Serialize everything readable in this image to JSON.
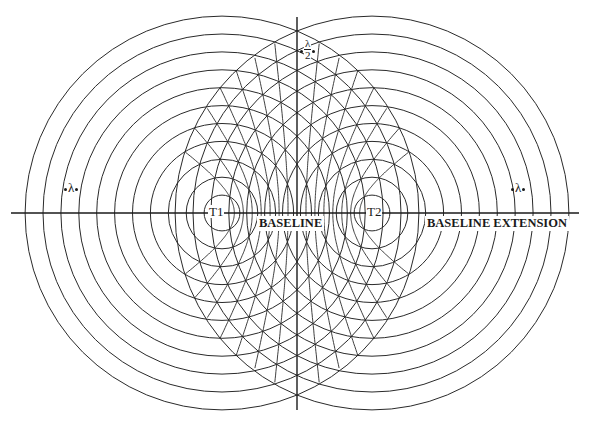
{
  "figure": {
    "type": "two-source interference pattern (circles and hyperbolas)",
    "line_color": "#2a2a2a",
    "background": "#ffffff"
  },
  "geometry": {
    "baseline_y": 213,
    "baseline_x_start": 11,
    "baseline_x_end": 579,
    "center_line_x": 297,
    "center_line_y_start": 17,
    "center_line_y_end": 410,
    "source_1": {
      "x": 222,
      "y": 213
    },
    "source_2": {
      "x": 372,
      "y": 213
    },
    "ring_spacing": 17.9,
    "ring_count": 11,
    "hyperbola_orders": [
      -7,
      -6,
      -5,
      -4,
      -3,
      -2,
      -1,
      1,
      2,
      3,
      4,
      5,
      6,
      7
    ]
  },
  "labels": {
    "source_1": "T1",
    "source_2": "T2",
    "baseline": "BASELINE",
    "baseline_extension": "BASELINE EXTENSION",
    "wavelength_left": "λ",
    "wavelength_right": "λ",
    "half_wavelength_num": "λ",
    "half_wavelength_den": "2"
  }
}
